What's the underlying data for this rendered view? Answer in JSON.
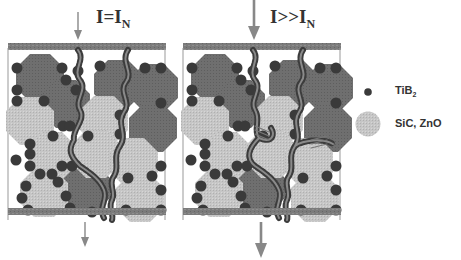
{
  "panels": [
    {
      "id": "normal",
      "label_main": "I=I",
      "label_sub": "N",
      "current": "nominal"
    },
    {
      "id": "overload",
      "label_main": "I>>I",
      "label_sub": "N",
      "current": "overcurrent"
    }
  ],
  "legend": {
    "items": [
      {
        "symbol": "small-dark-dot",
        "label_main": "TiB",
        "label_sub": "2"
      },
      {
        "symbol": "large-light-grain",
        "label_main": "SiC, ZnO",
        "label_sub": ""
      }
    ]
  },
  "colors": {
    "electrode": "#7a7a7a",
    "dark_grain": "#6e6e6e",
    "light_grain": "#c4c4c4",
    "tib2_dot": "#3a3a3a",
    "arrow": "#888888"
  }
}
